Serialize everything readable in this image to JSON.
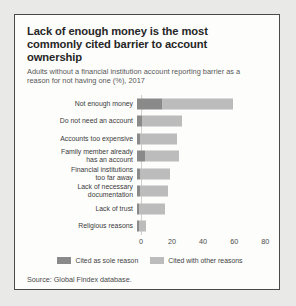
{
  "card": {
    "title": "Lack of enough money is the most commonly cited barrier to account ownership",
    "subtitle": "Adults without a financial institution account reporting barrier as a reason for not having one (%), 2017",
    "source": "Source: Global Findex database."
  },
  "legend": {
    "sole_label": "Cited as sole reason",
    "other_label": "Cited with other reasons",
    "sole_color": "#8a8a8a",
    "other_color": "#bcbcbc"
  },
  "chart_data": {
    "type": "bar",
    "orientation": "horizontal",
    "stacked": true,
    "title": "Lack of enough money is the most commonly cited barrier to account ownership",
    "subtitle": "Adults without a financial institution account reporting barrier as a reason for not having one (%), 2017",
    "xlabel": "",
    "ylabel": "",
    "xlim": [
      0,
      85
    ],
    "xticks": [
      0,
      20,
      40,
      60,
      80
    ],
    "grid": false,
    "legend_position": "bottom",
    "categories": [
      "Not enough money",
      "Do not need an account",
      "Accounts too expensive",
      "Family member already\nhas an account",
      "Financial institutions\ntoo far away",
      "Lack of necessary\ndocumentation",
      "Lack of trust",
      "Religious reasons"
    ],
    "series": [
      {
        "name": "Cited as sole reason",
        "color": "#8a8a8a",
        "values": [
          16,
          3,
          2,
          5,
          2,
          2,
          1,
          1
        ]
      },
      {
        "name": "Cited with other reasons",
        "color": "#bcbcbc",
        "values": [
          46,
          26,
          24,
          22,
          19,
          18,
          17,
          5
        ]
      }
    ],
    "totals": [
      62,
      29,
      26,
      27,
      21,
      20,
      18,
      6
    ]
  }
}
